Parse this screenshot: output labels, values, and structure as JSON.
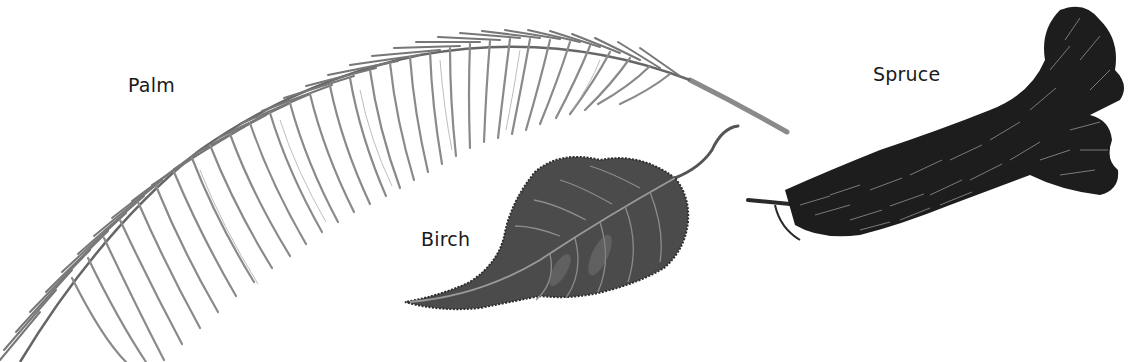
{
  "figure": {
    "type": "labeled botanical illustration",
    "background": "#ffffff",
    "labels": {
      "palm": "Palm",
      "birch": "Birch",
      "spruce": "Spruce"
    },
    "items": [
      {
        "name": "Palm",
        "kind": "palm frond",
        "tone": "light gray pencil",
        "color": "#6e6e6e"
      },
      {
        "name": "Birch",
        "kind": "birch leaf",
        "tone": "dark gray",
        "color": "#4a4a4a"
      },
      {
        "name": "Spruce",
        "kind": "spruce branch",
        "tone": "near black",
        "color": "#1c1c1c"
      }
    ]
  }
}
